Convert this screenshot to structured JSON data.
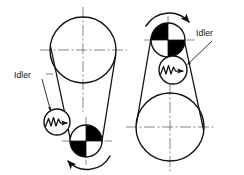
{
  "figure": {
    "type": "engineering-line-diagram",
    "background_color": "#ffffff",
    "line_color": "#111111",
    "fill_color": "#000000",
    "centerline_color": "#555555",
    "width": 244,
    "height": 175
  },
  "labels": {
    "left_idler": "Idler",
    "right_idler": "Idler"
  },
  "diagrams": [
    {
      "name": "left-diagram",
      "description": "Large driven pulley on top, small quadrant-shaded pulley at bottom right, spring-loaded idler pressing the left belt span",
      "pulleys": [
        {
          "name": "large-pulley",
          "cx": 83,
          "cy": 50,
          "r": 33,
          "shaded": false
        },
        {
          "name": "small-pulley",
          "cx": 86,
          "cy": 141,
          "r": 16,
          "shaded": true,
          "shaded_quadrants": [
            "top-right",
            "bottom-left"
          ]
        },
        {
          "name": "idler-pulley",
          "cx": 57,
          "cy": 122,
          "r": 13,
          "spring": true
        }
      ],
      "rotation_arrow": {
        "name": "rotation-arrow-bottom",
        "direction": "counterclockwise",
        "cx": 86,
        "cy": 141,
        "r": 26
      }
    },
    {
      "name": "right-diagram",
      "description": "Small quadrant-shaded driver pulley on top, large pulley at bottom, spring-loaded idler pressing the right belt span",
      "pulleys": [
        {
          "name": "small-pulley",
          "cx": 168,
          "cy": 40,
          "r": 17,
          "shaded": true,
          "shaded_quadrants": [
            "top-left",
            "bottom-right"
          ]
        },
        {
          "name": "large-pulley",
          "cx": 170,
          "cy": 127,
          "r": 34,
          "shaded": false
        },
        {
          "name": "idler-pulley",
          "cx": 173,
          "cy": 70,
          "r": 14,
          "spring": true
        }
      ],
      "rotation_arrow": {
        "name": "rotation-arrow-top",
        "direction": "clockwise",
        "cx": 168,
        "cy": 40,
        "r": 27
      }
    }
  ],
  "leaders": [
    {
      "name": "leader-line-left",
      "from": [
        44,
        79
      ],
      "to": [
        50,
        110
      ]
    },
    {
      "name": "leader-line-right",
      "from": [
        212,
        40
      ],
      "to": [
        186,
        64
      ]
    }
  ]
}
